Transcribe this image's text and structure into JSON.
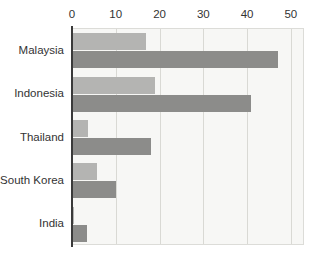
{
  "chart_data": {
    "type": "bar",
    "orientation": "horizontal",
    "title": "",
    "subtitle": "",
    "xlabel": "",
    "ylabel": "",
    "categories": [
      "Malaysia",
      "Indonesia",
      "Thailand",
      "South Korea",
      "India"
    ],
    "series": [
      {
        "name": "series-1",
        "color": "#b4b4b2",
        "values": [
          17,
          19,
          3.7,
          5.7,
          0.5
        ]
      },
      {
        "name": "series-2",
        "color": "#8c8c8a",
        "values": [
          47,
          41,
          18,
          10,
          3.4
        ]
      }
    ],
    "xlim": [
      0,
      53
    ],
    "xticks": [
      0,
      10,
      20,
      30,
      40,
      50
    ],
    "xtick_labels": [
      "0",
      "10",
      "20",
      "30",
      "40",
      "50"
    ],
    "grid": true,
    "grid_axis": "x",
    "legend": false,
    "legend_position": "none",
    "annotations": []
  },
  "style": {
    "plot_background": "#f7f7f5",
    "gridline_color": "#d9d9d4",
    "axis_color": "#3a3a3a",
    "tick_label_color": "#333333",
    "plot_border_color": "#dcdcd8"
  }
}
